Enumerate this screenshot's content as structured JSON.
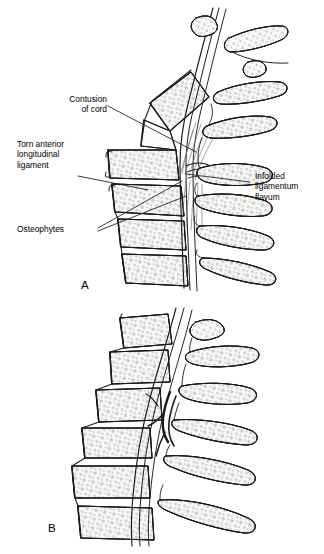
{
  "figure": {
    "title_alt": "Cervical spine injury illustration",
    "background_color": "#ffffff",
    "ink_color": "#1a1a1a",
    "bone_fill": "#f7f7f5",
    "stipple_color": "#8a8a8a"
  },
  "panels": [
    {
      "id": "A",
      "letter": "A"
    },
    {
      "id": "B",
      "letter": "B"
    }
  ],
  "labels": [
    {
      "id": "contusion-of-cord",
      "text": "Contusion\nof cord",
      "align": "right",
      "x": 105,
      "y": 98
    },
    {
      "id": "torn-anterior-longitudinal-ligament",
      "text": "Torn anterior\nlongitudinal\nligament",
      "align": "left",
      "x": 17,
      "y": 143
    },
    {
      "id": "osteophytes",
      "text": "Osteophytes",
      "align": "left",
      "x": 17,
      "y": 228
    },
    {
      "id": "infolded-ligamentum-flavum",
      "text": "Infolded\nligamentum\nflavum",
      "align": "left",
      "x": 255,
      "y": 176
    }
  ],
  "label_lines": [
    {
      "id": "leader-contusion",
      "points": "108,106 196,152"
    },
    {
      "id": "leader-torn-alv",
      "points": "78,176 148,190"
    },
    {
      "id": "leader-osteophytes-upper",
      "points": "98,228 182,181"
    },
    {
      "id": "leader-osteophytes-lower",
      "points": "98,231 186,196"
    },
    {
      "id": "leader-ligamentum-flavum",
      "points": "250,182 186,174"
    }
  ]
}
